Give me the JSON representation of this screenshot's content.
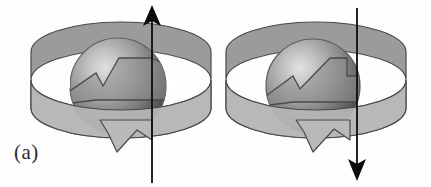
{
  "figure": {
    "label": "(a)",
    "background_color": "#fdfdfd",
    "width": 431,
    "height": 187,
    "caption_position": "bottom-left"
  },
  "colors": {
    "sphere_highlight": "#d6d6d6",
    "sphere_midtone": "#9a9a9a",
    "sphere_shadow": "#4f4f4f",
    "sphere_outline": "#5a5a5a",
    "ribbon_top_fill": "#a8a8a8",
    "ribbon_front_fill": "#b4b4b4",
    "ribbon_bottom_fill": "#b9b9b9",
    "ribbon_dark_fill": "#7d7d7d",
    "ribbon_outline": "#4a4a4a",
    "axis_arrow_color": "#0d0d0d",
    "label_color": "#2b2b2b",
    "gap_color": "#ffffff"
  },
  "panels": [
    {
      "id": "left",
      "name": "sphere-with-up-axis",
      "sphere": {
        "center_x": 118,
        "center_y": 86,
        "radius": 48,
        "highlight_x": 104,
        "highlight_y": 70
      },
      "ribbon": {
        "center_x": 121,
        "center_y": 80,
        "radius_x": 90,
        "radius_y": 30,
        "band_height": 44,
        "direction": "counterclockwise",
        "tail_arrowhead": "bottom-center"
      },
      "axis_arrow": {
        "x": 152,
        "y_top": 6,
        "y_bottom": 183,
        "direction": "up",
        "arrowhead_at": "top",
        "line_width": 1.6
      }
    },
    {
      "id": "right",
      "name": "sphere-with-down-axis",
      "sphere": {
        "center_x": 313,
        "center_y": 86,
        "radius": 47,
        "highlight_x": 300,
        "highlight_y": 70
      },
      "ribbon": {
        "center_x": 316,
        "center_y": 80,
        "radius_x": 90,
        "radius_y": 30,
        "band_height": 44,
        "direction": "counterclockwise",
        "tail_arrowhead": "bottom-center"
      },
      "axis_arrow": {
        "x": 357,
        "y_top": 8,
        "y_bottom": 180,
        "direction": "down",
        "arrowhead_at": "bottom",
        "line_width": 1.6
      }
    }
  ]
}
